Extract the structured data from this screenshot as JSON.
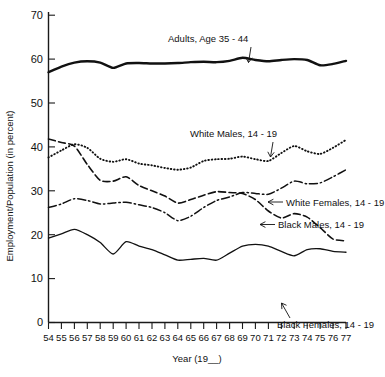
{
  "chart_data": {
    "type": "line",
    "title": "",
    "xlabel": "Year (19__)",
    "ylabel": "Employment/Population (in percent)",
    "xlim": [
      54,
      77
    ],
    "ylim": [
      0,
      70
    ],
    "grid": false,
    "legend_position": "inline-annotations",
    "x": [
      54,
      55,
      56,
      57,
      58,
      59,
      60,
      61,
      62,
      63,
      64,
      65,
      66,
      67,
      68,
      69,
      70,
      71,
      72,
      73,
      74,
      75,
      76,
      77
    ],
    "ytick_labels": [
      "0",
      "10",
      "20",
      "30",
      "40",
      "50",
      "60",
      "70"
    ],
    "ytick_values": [
      0,
      10,
      20,
      30,
      40,
      50,
      60,
      70
    ],
    "xtick_labels": [
      "54",
      "55",
      "56",
      "57",
      "58",
      "59",
      "60",
      "61",
      "62",
      "63",
      "64",
      "65",
      "66",
      "67",
      "68",
      "69",
      "70",
      "71",
      "72",
      "73",
      "74",
      "75",
      "76",
      "77"
    ],
    "series": [
      {
        "name": "Adults, Age 35-44",
        "style": "solid-thick",
        "label": "Adults,  Age 35 - 44",
        "values": [
          57.0,
          58.3,
          59.2,
          59.5,
          59.2,
          58.0,
          59.0,
          59.1,
          59.0,
          59.0,
          59.1,
          59.3,
          59.4,
          59.3,
          59.6,
          60.3,
          59.8,
          59.5,
          59.8,
          60.0,
          59.8,
          58.6,
          58.9,
          59.6
        ]
      },
      {
        "name": "White Males, 14-19",
        "style": "dotted",
        "label": "White Males,  14 - 19",
        "values": [
          37.6,
          39.2,
          40.6,
          39.8,
          37.3,
          36.6,
          37.2,
          36.2,
          35.8,
          35.2,
          34.8,
          35.3,
          36.8,
          37.2,
          37.3,
          37.8,
          37.2,
          36.8,
          38.6,
          40.2,
          39.0,
          38.4,
          39.8,
          41.6
        ]
      },
      {
        "name": "White Females, 14-19",
        "style": "dash-dot",
        "label": "White Females,  14 - 19",
        "values": [
          26.2,
          27.0,
          28.2,
          27.8,
          27.0,
          27.2,
          27.4,
          26.8,
          26.2,
          25.0,
          23.2,
          24.2,
          26.2,
          27.8,
          28.6,
          29.6,
          29.4,
          29.2,
          30.6,
          32.2,
          31.6,
          31.8,
          33.2,
          34.8
        ]
      },
      {
        "name": "Black Males, 14-19",
        "style": "dashed",
        "label": "Black Males,  14 - 19",
        "values": [
          41.8,
          41.0,
          40.2,
          36.0,
          32.4,
          32.2,
          33.2,
          31.2,
          30.0,
          28.8,
          27.2,
          28.0,
          29.0,
          29.8,
          29.6,
          29.4,
          28.0,
          25.4,
          23.8,
          24.8,
          24.0,
          21.6,
          19.0,
          18.6
        ]
      },
      {
        "name": "Black Females, 14-19",
        "style": "solid-thin",
        "label": "Black Females,  14 - 19",
        "values": [
          19.2,
          20.2,
          21.2,
          20.0,
          18.2,
          15.6,
          18.4,
          17.4,
          16.6,
          15.4,
          14.2,
          14.4,
          14.6,
          14.2,
          15.8,
          17.4,
          17.8,
          17.4,
          16.2,
          15.2,
          16.6,
          16.8,
          16.2,
          16.0
        ]
      }
    ],
    "annotations": [
      {
        "name": "adults-annotation",
        "text": "Adults,  Age 35 - 44",
        "x": 232,
        "y": 42
      },
      {
        "name": "white-males-annotation",
        "text": "White Males,  14 - 19",
        "x": 253,
        "y": 137
      },
      {
        "name": "white-females-annotation",
        "text": "White Females,  14 - 19",
        "x": 284,
        "y": 205
      },
      {
        "name": "black-males-annotation",
        "text": "Black Males,  14 - 19",
        "x": 276,
        "y": 228
      },
      {
        "name": "black-females-annotation",
        "text": "Black Females,  14 - 19",
        "x": 286,
        "y": 327
      }
    ]
  }
}
